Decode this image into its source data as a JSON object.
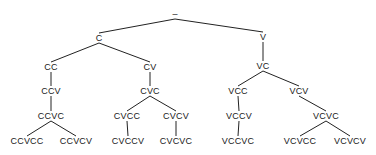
{
  "diagram": {
    "type": "tree",
    "root": "–",
    "nodes": [
      {
        "id": "root",
        "label": "–",
        "x": 175,
        "y": 14
      },
      {
        "id": "C",
        "label": "C",
        "x": 99,
        "y": 38
      },
      {
        "id": "V",
        "label": "V",
        "x": 263,
        "y": 37
      },
      {
        "id": "CC",
        "label": "CC",
        "x": 51,
        "y": 67
      },
      {
        "id": "CV",
        "label": "CV",
        "x": 150,
        "y": 67
      },
      {
        "id": "VC",
        "label": "VC",
        "x": 263,
        "y": 66
      },
      {
        "id": "CCV",
        "label": "CCV",
        "x": 51,
        "y": 91
      },
      {
        "id": "CVC",
        "label": "CVC",
        "x": 150,
        "y": 91
      },
      {
        "id": "VCC",
        "label": "VCC",
        "x": 238,
        "y": 91
      },
      {
        "id": "VCV",
        "label": "VCV",
        "x": 299,
        "y": 91
      },
      {
        "id": "CCVC",
        "label": "CCVC",
        "x": 51,
        "y": 116
      },
      {
        "id": "CVCC",
        "label": "CVCC",
        "x": 127,
        "y": 116
      },
      {
        "id": "CVCV",
        "label": "CVCV",
        "x": 176,
        "y": 116
      },
      {
        "id": "VCCV",
        "label": "VCCV",
        "x": 239,
        "y": 116
      },
      {
        "id": "VCVC",
        "label": "VCVC",
        "x": 326,
        "y": 116
      },
      {
        "id": "CCVCC",
        "label": "CCVCC",
        "x": 27,
        "y": 141
      },
      {
        "id": "CCVCV",
        "label": "CCVCV",
        "x": 76,
        "y": 141
      },
      {
        "id": "CVCCV",
        "label": "CVCCV",
        "x": 128,
        "y": 141
      },
      {
        "id": "CVCVC",
        "label": "CVCVC",
        "x": 176,
        "y": 141
      },
      {
        "id": "VCCVC",
        "label": "VCCVC",
        "x": 238,
        "y": 141
      },
      {
        "id": "VCVCC",
        "label": "VCVCC",
        "x": 300,
        "y": 141
      },
      {
        "id": "VCVCV",
        "label": "VCVCV",
        "x": 350,
        "y": 141
      }
    ],
    "edges": [
      [
        "root",
        "C"
      ],
      [
        "root",
        "V"
      ],
      [
        "C",
        "CC"
      ],
      [
        "C",
        "CV"
      ],
      [
        "V",
        "VC"
      ],
      [
        "CC",
        "CCV"
      ],
      [
        "CV",
        "CVC"
      ],
      [
        "VC",
        "VCC"
      ],
      [
        "VC",
        "VCV"
      ],
      [
        "CCV",
        "CCVC"
      ],
      [
        "CVC",
        "CVCC"
      ],
      [
        "CVC",
        "CVCV"
      ],
      [
        "VCC",
        "VCCV"
      ],
      [
        "VCV",
        "VCVC"
      ],
      [
        "CCVC",
        "CCVCC"
      ],
      [
        "CCVC",
        "CCVCV"
      ],
      [
        "CVCC",
        "CVCCV"
      ],
      [
        "CVCV",
        "CVCVC"
      ],
      [
        "VCCV",
        "VCCVC"
      ],
      [
        "VCVC",
        "VCVCC"
      ],
      [
        "VCVC",
        "VCVCV"
      ]
    ],
    "line_color": "#222222",
    "text_color": "#1a1a1a"
  }
}
